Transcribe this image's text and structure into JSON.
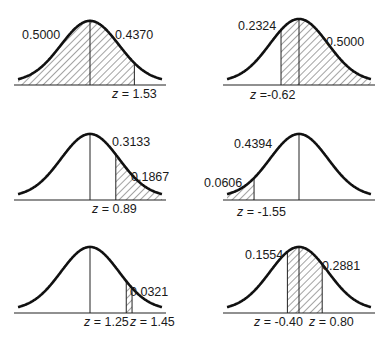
{
  "panels": [
    {
      "id": "p1",
      "origin": {
        "x": 0,
        "y": 0
      },
      "mean_x": 90,
      "baseline_y": 85,
      "peak_h": 63,
      "sigma_px": 29,
      "half_width": 72,
      "shade": [
        {
          "from_z": -4,
          "to_z": 1.53
        }
      ],
      "lines_z": [
        0,
        1.53
      ],
      "labels": [
        {
          "text": "0.5000",
          "x": 22,
          "y": 39
        },
        {
          "text": "0.4370",
          "x": 115,
          "y": 39
        },
        {
          "text": "z = 1.53",
          "x": 112,
          "y": 98,
          "z": true
        }
      ]
    },
    {
      "id": "p2",
      "origin": {
        "x": 0,
        "y": 0
      },
      "mean_x": 299,
      "baseline_y": 85,
      "peak_h": 65,
      "sigma_px": 29,
      "half_width": 72,
      "shade": [
        {
          "from_z": -0.62,
          "to_z": 4
        }
      ],
      "lines_z": [
        -0.62,
        0
      ],
      "labels": [
        {
          "text": "0.2324",
          "x": 238,
          "y": 30
        },
        {
          "text": "0.5000",
          "x": 326,
          "y": 46
        },
        {
          "text": "z =-0.62",
          "x": 250,
          "y": 99,
          "z": true
        }
      ]
    },
    {
      "id": "p3",
      "origin": {
        "x": 0,
        "y": 0
      },
      "mean_x": 90,
      "baseline_y": 200,
      "peak_h": 65,
      "sigma_px": 29,
      "half_width": 72,
      "shade": [
        {
          "from_z": 0.89,
          "to_z": 4
        }
      ],
      "lines_z": [
        0,
        0.89
      ],
      "labels": [
        {
          "text": "0.3133",
          "x": 112,
          "y": 146
        },
        {
          "text": "0.1867",
          "x": 131,
          "y": 181
        },
        {
          "text": "z = 0.89",
          "x": 92,
          "y": 213,
          "z": true
        }
      ]
    },
    {
      "id": "p4",
      "origin": {
        "x": 0,
        "y": 0
      },
      "mean_x": 299,
      "baseline_y": 200,
      "peak_h": 65,
      "sigma_px": 29,
      "half_width": 72,
      "shade": [
        {
          "from_z": -4,
          "to_z": -1.55
        }
      ],
      "lines_z": [
        -1.55,
        0
      ],
      "labels": [
        {
          "text": "0.4394",
          "x": 234,
          "y": 148
        },
        {
          "text": "0.0606",
          "x": 204,
          "y": 187
        },
        {
          "text": "z = -1.55",
          "x": 237,
          "y": 216,
          "z": true
        }
      ]
    },
    {
      "id": "p5",
      "origin": {
        "x": 0,
        "y": 0
      },
      "mean_x": 90,
      "baseline_y": 313,
      "peak_h": 65,
      "sigma_px": 29,
      "half_width": 72,
      "shade": [
        {
          "from_z": 1.25,
          "to_z": 1.45
        }
      ],
      "lines_z": [
        0,
        1.25,
        1.45
      ],
      "labels": [
        {
          "text": "0.0321",
          "x": 130,
          "y": 296
        },
        {
          "text": "z = 1.25",
          "x": 84,
          "y": 326,
          "z": true
        },
        {
          "text": "z = 1.45",
          "x": 130,
          "y": 326,
          "z": true
        }
      ]
    },
    {
      "id": "p6",
      "origin": {
        "x": 0,
        "y": 0
      },
      "mean_x": 299,
      "baseline_y": 313,
      "peak_h": 65,
      "sigma_px": 29,
      "half_width": 72,
      "shade": [
        {
          "from_z": -0.4,
          "to_z": 0.8
        }
      ],
      "lines_z": [
        -0.4,
        0,
        0.8
      ],
      "labels": [
        {
          "text": "0.1554",
          "x": 245,
          "y": 259
        },
        {
          "text": "0.2881",
          "x": 322,
          "y": 270
        },
        {
          "text": "z = -0.40",
          "x": 254,
          "y": 326,
          "z": true
        },
        {
          "text": "z = 0.80",
          "x": 309,
          "y": 326,
          "z": true
        }
      ]
    }
  ],
  "chart_data": [
    {
      "type": "area",
      "title": "Normal curve area",
      "z": [
        1.53
      ],
      "areas": {
        "left_of_mean": 0.5,
        "mean_to_z": 0.437
      }
    },
    {
      "type": "area",
      "title": "Normal curve area",
      "z": [
        -0.62
      ],
      "areas": {
        "z_to_mean": 0.2324,
        "right_of_mean": 0.5
      }
    },
    {
      "type": "area",
      "title": "Normal curve area",
      "z": [
        0.89
      ],
      "areas": {
        "mean_to_z": 0.3133,
        "right_tail": 0.1867
      }
    },
    {
      "type": "area",
      "title": "Normal curve area",
      "z": [
        -1.55
      ],
      "areas": {
        "z_to_mean": 0.4394,
        "left_tail": 0.0606
      }
    },
    {
      "type": "area",
      "title": "Normal curve area",
      "z": [
        1.25,
        1.45
      ],
      "areas": {
        "between": 0.0321
      }
    },
    {
      "type": "area",
      "title": "Normal curve area",
      "z": [
        -0.4,
        0.8
      ],
      "areas": {
        "neg_z_to_mean": 0.1554,
        "mean_to_pos_z": 0.2881
      }
    }
  ]
}
